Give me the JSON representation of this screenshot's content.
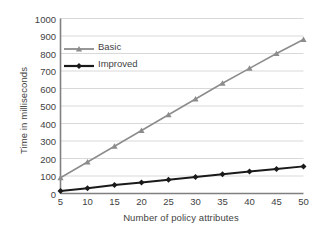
{
  "chart_data": {
    "type": "line",
    "title": "",
    "xlabel": "Number of policy attributes",
    "ylabel": "Time in milliseconds",
    "x": [
      5,
      10,
      15,
      20,
      25,
      30,
      35,
      40,
      45,
      50
    ],
    "categories": [
      "5",
      "10",
      "15",
      "20",
      "25",
      "30",
      "35",
      "40",
      "45",
      "50"
    ],
    "xlim": [
      5,
      50
    ],
    "ylim": [
      0,
      1000
    ],
    "yticks": [
      0,
      100,
      200,
      300,
      400,
      500,
      600,
      700,
      800,
      900,
      1000
    ],
    "ytick_labels": [
      "0",
      "100",
      "200",
      "300",
      "400",
      "500",
      "600",
      "700",
      "800",
      "900",
      "1000"
    ],
    "grid": "horizontal",
    "legend_position": "upper-left-inside",
    "series": [
      {
        "name": "Basic",
        "color": "#8c8c8c",
        "marker": "triangle",
        "values": [
          90,
          180,
          270,
          360,
          450,
          540,
          630,
          715,
          800,
          880
        ]
      },
      {
        "name": "Improved",
        "color": "#1a1a1a",
        "marker": "diamond",
        "values": [
          14,
          30,
          48,
          63,
          79,
          94,
          110,
          126,
          140,
          155
        ]
      }
    ]
  },
  "legend": {
    "items": [
      {
        "label": "Basic"
      },
      {
        "label": "Improved"
      }
    ]
  },
  "colors": {
    "basic": "#8c8c8c",
    "improved": "#1a1a1a",
    "axis": "#808080",
    "grid": "#d9d9d9",
    "text": "#3f3f3f",
    "background": "#ffffff"
  }
}
